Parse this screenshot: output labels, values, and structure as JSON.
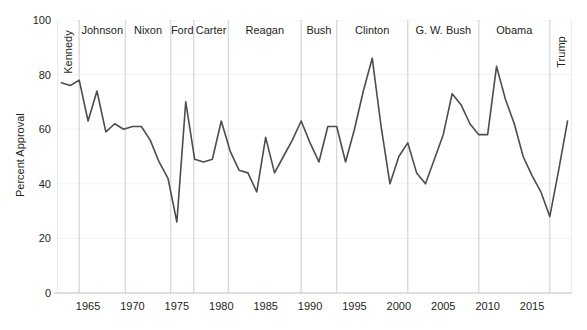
{
  "chart_data": {
    "type": "line",
    "title": "",
    "xlabel": "",
    "ylabel": "Percent Approval",
    "xlim": [
      1961.5,
      2019.5
    ],
    "ylim": [
      0,
      100
    ],
    "grid": true,
    "legend": "none",
    "line_color": "#4d4d4d",
    "divider_color": "#d9d9d9",
    "grid_color": "#f2f2f2",
    "axis_color": "#bfbfbf",
    "y_ticks": [
      0,
      20,
      40,
      60,
      80,
      100
    ],
    "x_ticks": [
      1965,
      1970,
      1975,
      1980,
      1985,
      1990,
      1995,
      2000,
      2005,
      2010,
      2015
    ],
    "series": [
      {
        "name": "Presidential Approval",
        "x": [
          1962,
          1963,
          1964,
          1965,
          1966,
          1967,
          1968,
          1969,
          1970,
          1971,
          1972,
          1973,
          1974,
          1975,
          1976,
          1977,
          1978,
          1979,
          1980,
          1981,
          1982,
          1983,
          1984,
          1985,
          1986,
          1987,
          1988,
          1989,
          1990,
          1991,
          1992,
          1993,
          1994,
          1995,
          1996,
          1997,
          1998,
          1999,
          2000,
          2001,
          2002,
          2003,
          2004,
          2005,
          2006,
          2007,
          2008,
          2009,
          2010,
          2011,
          2012,
          2013,
          2014,
          2015,
          2016,
          2017,
          2018,
          2019
        ],
        "y": [
          77,
          76,
          78,
          63,
          74,
          59,
          62,
          60,
          61,
          61,
          56,
          48,
          42,
          26,
          70,
          49,
          48,
          49,
          63,
          52,
          45,
          44,
          37,
          57,
          44,
          50,
          56,
          63,
          55,
          48,
          61,
          61,
          48,
          60,
          74,
          86,
          61,
          40,
          50,
          55,
          44,
          40,
          49,
          58,
          73,
          69,
          62,
          58,
          58,
          83,
          71,
          62,
          50,
          43,
          37,
          28,
          45,
          63
        ],
        "notes": "Annual average presidential job approval, 1962-2019"
      }
    ],
    "presidential_terms": [
      {
        "name": "Kennedy",
        "start": 1961.5,
        "end": 1964.0,
        "orientation": "vertical"
      },
      {
        "name": "Johnson",
        "start": 1964.0,
        "end": 1969.2,
        "orientation": "horizontal"
      },
      {
        "name": "Nixon",
        "start": 1969.2,
        "end": 1974.3,
        "orientation": "horizontal"
      },
      {
        "name": "Ford",
        "start": 1974.3,
        "end": 1976.9,
        "orientation": "horizontal"
      },
      {
        "name": "Carter",
        "start": 1976.9,
        "end": 1980.8,
        "orientation": "horizontal"
      },
      {
        "name": "Reagan",
        "start": 1980.8,
        "end": 1989.0,
        "orientation": "horizontal"
      },
      {
        "name": "Bush",
        "start": 1989.0,
        "end": 1993.0,
        "orientation": "horizontal"
      },
      {
        "name": "Clinton",
        "start": 1993.0,
        "end": 2001.0,
        "orientation": "horizontal"
      },
      {
        "name": "G. W. Bush",
        "start": 2001.0,
        "end": 2009.0,
        "orientation": "horizontal"
      },
      {
        "name": "Obama",
        "start": 2009.0,
        "end": 2017.0,
        "orientation": "horizontal"
      },
      {
        "name": "Trump",
        "start": 2017.0,
        "end": 2019.5,
        "orientation": "vertical"
      }
    ]
  }
}
